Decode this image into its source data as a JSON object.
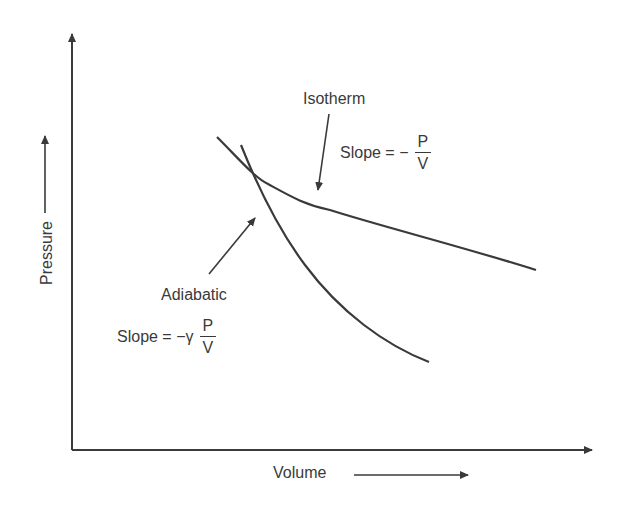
{
  "diagram": {
    "type": "pressure-volume diagram",
    "axes": {
      "x_label": "Volume",
      "y_label": "Pressure"
    },
    "curves": [
      {
        "name": "Isotherm",
        "slope_prefix": "Slope = −",
        "slope_numerator": "P",
        "slope_denominator": "V"
      },
      {
        "name": "Adiabatic",
        "slope_prefix": "Slope = −γ",
        "slope_numerator": "P",
        "slope_denominator": "V"
      }
    ],
    "colors": {
      "stroke": "#3a3a3a",
      "background": "#ffffff"
    }
  }
}
